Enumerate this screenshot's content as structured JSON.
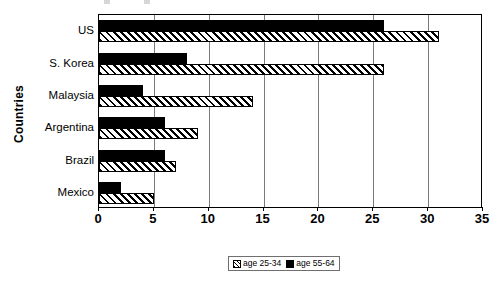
{
  "chart_data": {
    "type": "bar",
    "orientation": "horizontal",
    "title": "",
    "xlabel": "",
    "ylabel": "Countries",
    "categories": [
      "US",
      "S. Korea",
      "Malaysia",
      "Argentina",
      "Brazil",
      "Mexico"
    ],
    "series": [
      {
        "name": "age 25-34",
        "pattern": "diagonal-hatch",
        "color": "#000000",
        "values": [
          31,
          26,
          14,
          9,
          7,
          5
        ]
      },
      {
        "name": "age 55-64",
        "pattern": "solid",
        "color": "#000000",
        "values": [
          26,
          8,
          4,
          6,
          6,
          2
        ]
      }
    ],
    "xlim": [
      0,
      35
    ],
    "xticks": [
      0,
      5,
      10,
      15,
      20,
      25,
      30,
      35
    ],
    "xtick_labels": [
      "0",
      "5",
      "10",
      "15",
      "20",
      "25",
      "30",
      "35"
    ],
    "grid": "vertical",
    "legend_position": "bottom"
  },
  "axes": {
    "y_title": "Countries"
  },
  "legend": {
    "entries": [
      {
        "label": "age 25-34",
        "pattern": "diagonal-hatch"
      },
      {
        "label": "age 55-64",
        "pattern": "solid"
      }
    ]
  }
}
